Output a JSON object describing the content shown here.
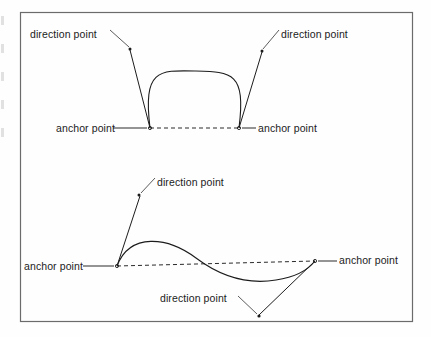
{
  "figure": {
    "background_color": "#fefefe",
    "frame_color": "#6b6b6b",
    "ink_color": "#1c1c1c",
    "frame": {
      "x": 20,
      "y": 12,
      "width": 393,
      "height": 310
    }
  },
  "labels": {
    "direction_point": "direction point",
    "anchor_point": "anchor point"
  },
  "diagrams": [
    {
      "name": "symmetric-arch-curve",
      "anchors": [
        {
          "name": "left-anchor",
          "x": 150,
          "y": 128
        },
        {
          "name": "right-anchor",
          "x": 239,
          "y": 128
        }
      ],
      "direction_points": [
        {
          "name": "left-direction-point",
          "x": 130,
          "y": 49
        },
        {
          "name": "right-direction-point",
          "x": 262,
          "y": 51
        }
      ],
      "curve_apex": {
        "x": 195,
        "y": 71
      },
      "label_positions": [
        {
          "text": "direction point",
          "x": 30,
          "y": 28
        },
        {
          "text": "direction point",
          "x": 281,
          "y": 28
        },
        {
          "text": "anchor point",
          "x": 56,
          "y": 122
        },
        {
          "text": "anchor point",
          "x": 258,
          "y": 122
        }
      ]
    },
    {
      "name": "s-shaped-curve",
      "anchors": [
        {
          "name": "left-anchor",
          "x": 117,
          "y": 266
        },
        {
          "name": "right-anchor",
          "x": 315,
          "y": 261
        }
      ],
      "direction_points": [
        {
          "name": "upper-direction-point",
          "x": 139,
          "y": 195
        },
        {
          "name": "lower-direction-point",
          "x": 259,
          "y": 316
        }
      ],
      "curve_peak": {
        "x": 147,
        "y": 240
      },
      "curve_trough": {
        "x": 245,
        "y": 277
      },
      "label_positions": [
        {
          "text": "direction point",
          "x": 157,
          "y": 176
        },
        {
          "text": "anchor point",
          "x": 24,
          "y": 260
        },
        {
          "text": "anchor point",
          "x": 339,
          "y": 254
        },
        {
          "text": "direction point",
          "x": 160,
          "y": 292
        }
      ]
    }
  ]
}
